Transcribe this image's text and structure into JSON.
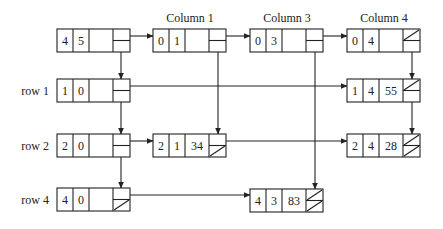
{
  "diagram": {
    "type": "sparse-matrix-linked-list",
    "column_labels": [
      {
        "id": "col1",
        "text": "Column 1"
      },
      {
        "id": "col3",
        "text": "Column 3"
      },
      {
        "id": "col4",
        "text": "Column 4"
      }
    ],
    "row_labels": [
      {
        "id": "row1",
        "text": "row 1"
      },
      {
        "id": "row2",
        "text": "row 2"
      },
      {
        "id": "row4",
        "text": "row 4"
      }
    ],
    "nodes": {
      "head": {
        "a": "4",
        "b": "5",
        "c": "",
        "right_null": false,
        "down_null": false
      },
      "col1": {
        "a": "0",
        "b": "1",
        "c": "",
        "right_null": false,
        "down_null": false
      },
      "col3": {
        "a": "0",
        "b": "3",
        "c": "",
        "right_null": false,
        "down_null": false
      },
      "col4": {
        "a": "0",
        "b": "4",
        "c": "",
        "right_null": true,
        "down_null": false
      },
      "row1": {
        "a": "1",
        "b": "0",
        "c": "",
        "right_null": false,
        "down_null": false
      },
      "row2": {
        "a": "2",
        "b": "0",
        "c": "",
        "right_null": false,
        "down_null": false
      },
      "row4": {
        "a": "4",
        "b": "0",
        "c": "",
        "right_null": false,
        "down_null": true
      },
      "e14": {
        "a": "1",
        "b": "4",
        "c": "55",
        "right_null": true,
        "down_null": false
      },
      "e21": {
        "a": "2",
        "b": "1",
        "c": "34",
        "right_null": false,
        "down_null": true
      },
      "e24": {
        "a": "2",
        "b": "4",
        "c": "28",
        "right_null": true,
        "down_null": true
      },
      "e43": {
        "a": "4",
        "b": "3",
        "c": "83",
        "right_null": true,
        "down_null": true
      }
    },
    "edges": [
      {
        "from": "head",
        "to": "col1",
        "dir": "right"
      },
      {
        "from": "col1",
        "to": "col3",
        "dir": "right"
      },
      {
        "from": "col3",
        "to": "col4",
        "dir": "right"
      },
      {
        "from": "head",
        "to": "row1",
        "dir": "down"
      },
      {
        "from": "row1",
        "to": "row2",
        "dir": "down"
      },
      {
        "from": "row2",
        "to": "row4",
        "dir": "down"
      },
      {
        "from": "row1",
        "to": "e14",
        "dir": "right"
      },
      {
        "from": "row2",
        "to": "e21",
        "dir": "right"
      },
      {
        "from": "e21",
        "to": "e24",
        "dir": "right"
      },
      {
        "from": "row4",
        "to": "e43",
        "dir": "right"
      },
      {
        "from": "col1",
        "to": "e21",
        "dir": "down"
      },
      {
        "from": "col3",
        "to": "e43",
        "dir": "down"
      },
      {
        "from": "col4",
        "to": "e14",
        "dir": "down"
      },
      {
        "from": "e14",
        "to": "e24",
        "dir": "down"
      }
    ]
  }
}
